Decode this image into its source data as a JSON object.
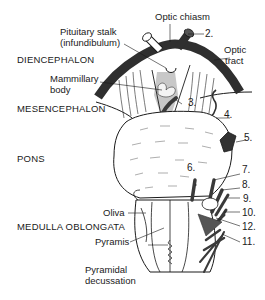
{
  "diagram": {
    "type": "anatomical-illustration",
    "regions": [
      {
        "id": "diencephalon",
        "label": "DIENCEPHALON"
      },
      {
        "id": "mesencephalon",
        "label": "MESENCEPHALON"
      },
      {
        "id": "pons",
        "label": "PONS"
      },
      {
        "id": "medulla",
        "label": "MEDULLA OBLONGATA"
      }
    ],
    "structures": [
      {
        "id": "optic_chiasm",
        "label": "Optic chiasm"
      },
      {
        "id": "pituitary_stalk",
        "label": "Pituitary stalk",
        "label2": "(infundibulum)"
      },
      {
        "id": "optic_tract",
        "label": "Optic",
        "label2": "tract"
      },
      {
        "id": "mammillary_body",
        "label": "Mammillary",
        "label2": "body"
      },
      {
        "id": "oliva",
        "label": "Oliva"
      },
      {
        "id": "pyramis",
        "label": "Pyramis"
      },
      {
        "id": "pyramidal_decussation",
        "label": "Pyramidal",
        "label2": "decussation"
      }
    ],
    "cranial_nerves": [
      "2.",
      "3.",
      "4.",
      "5.",
      "6.",
      "7.",
      "8.",
      "9.",
      "10.",
      "12.",
      "11."
    ],
    "colors": {
      "line": "#1a1a1a",
      "dark_fill": "#3a3a3a",
      "shade": "#9a9a9a",
      "background": "#ffffff"
    }
  }
}
